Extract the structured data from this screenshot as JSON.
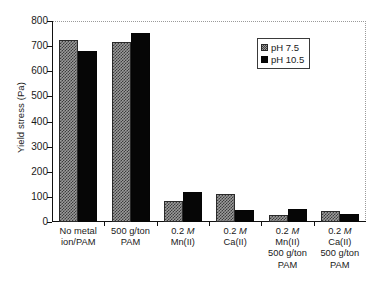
{
  "chart_data": {
    "type": "bar",
    "title": "",
    "xlabel": "",
    "ylabel": "Yield stress (Pa)",
    "ylim": [
      0,
      800
    ],
    "yticks": [
      0,
      100,
      200,
      300,
      400,
      500,
      600,
      700,
      800
    ],
    "ytick_labels": [
      "0",
      "100",
      "200",
      "300",
      "400",
      "500",
      "600",
      "700",
      "800"
    ],
    "grid": false,
    "legend_position": "upper right",
    "categories": [
      "No metal ion/PAM",
      "500 g/ton PAM",
      "0.2 M Mn(II)",
      "0.2 M Ca(II)",
      "0.2 M Mn(II) 500 g/ton PAM",
      "0.2 M Ca(II) 500 g/ton PAM"
    ],
    "category_lines": [
      [
        "No metal",
        "ion/PAM"
      ],
      [
        "500 g/ton",
        "PAM"
      ],
      [
        "0.2 M",
        "Mn(II)"
      ],
      [
        "0.2 M",
        "Ca(II)"
      ],
      [
        "0.2 M",
        "Mn(II)",
        "500 g/ton",
        "PAM"
      ],
      [
        "0.2 M",
        "Ca(II)",
        "500 g/ton",
        "PAM"
      ]
    ],
    "series": [
      {
        "name": "pH 7.5",
        "color": "#9b9b9b",
        "pattern": "checkered",
        "values": [
          725,
          718,
          85,
          113,
          27,
          42
        ]
      },
      {
        "name": "pH 10.5",
        "color": "#060606",
        "pattern": "solid",
        "values": [
          680,
          752,
          118,
          48,
          50,
          32
        ]
      }
    ]
  },
  "legend": {
    "items": [
      {
        "label": "pH 7.5",
        "swatch": "checkered-gray-swatch"
      },
      {
        "label": "pH 10.5",
        "swatch": "solid-black-swatch"
      }
    ]
  },
  "axis": {
    "y_title": "Yield stress (Pa)"
  }
}
